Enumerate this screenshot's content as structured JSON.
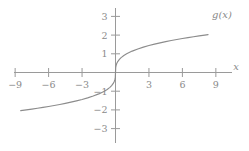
{
  "chart_data": {
    "type": "line",
    "title": "",
    "xlabel": "x",
    "ylabel": "",
    "curve_label": "g(x)",
    "function": "g(x) = cbrt(x)",
    "grid": false,
    "legend": "inline-right-of-curve",
    "xlim": [
      -10.5,
      10.5
    ],
    "ylim": [
      -3.6,
      3.6
    ],
    "xticks": [
      -9,
      -6,
      -3,
      3,
      6,
      9
    ],
    "xtick_labels": [
      "−9",
      "−6",
      "−3",
      "3",
      "6",
      "9"
    ],
    "yticks": [
      -3,
      -2,
      -1,
      1,
      2,
      3
    ],
    "ytick_labels": [
      "−3",
      "−2",
      "−1",
      "1",
      "2",
      "3"
    ],
    "x": [
      -8.5,
      -8.0,
      -7.5,
      -7.0,
      -6.5,
      -6.0,
      -5.5,
      -5.0,
      -4.5,
      -4.0,
      -3.5,
      -3.0,
      -2.5,
      -2.0,
      -1.5,
      -1.0,
      -0.75,
      -0.5,
      -0.35,
      -0.2,
      -0.1,
      -0.05,
      -0.02,
      0.0,
      0.02,
      0.05,
      0.1,
      0.2,
      0.35,
      0.5,
      0.75,
      1.0,
      1.5,
      2.0,
      2.5,
      3.0,
      3.5,
      4.0,
      4.5,
      5.0,
      5.5,
      6.0,
      6.5,
      7.0,
      7.5,
      8.0,
      8.3
    ],
    "values": [
      -2.04,
      -2.0,
      -1.957,
      -1.913,
      -1.866,
      -1.817,
      -1.765,
      -1.71,
      -1.651,
      -1.587,
      -1.518,
      -1.442,
      -1.357,
      -1.26,
      -1.145,
      -1.0,
      -0.909,
      -0.794,
      -0.705,
      -0.585,
      -0.464,
      -0.368,
      -0.271,
      0.0,
      0.271,
      0.368,
      0.464,
      0.585,
      0.705,
      0.794,
      0.909,
      1.0,
      1.145,
      1.26,
      1.357,
      1.442,
      1.518,
      1.587,
      1.651,
      1.71,
      1.765,
      1.817,
      1.866,
      1.913,
      1.957,
      2.0,
      2.025
    ],
    "colors": {
      "axis": "#9a9a9a",
      "curve": "#8c8c8c",
      "text": "#8a8a8a",
      "background": "#ffffff"
    }
  }
}
